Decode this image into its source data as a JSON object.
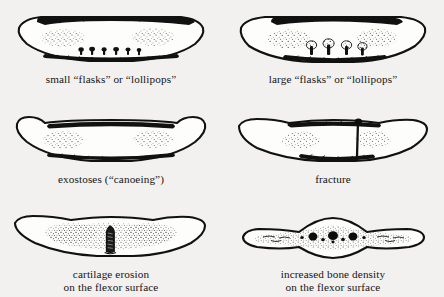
{
  "figure": {
    "background_color": "#f2f1ef",
    "ink_color": "#111111",
    "layout": "2 columns x 3 rows of labelled anatomical line drawings",
    "panels": [
      {
        "id": "small-flasks",
        "caption": "small “flasks” or “lollipops”",
        "drawing_name": "bone-cross-section-small-flasks",
        "description": "Lens-shaped bone cross-section with dense cortical bands top and bottom and small flask-shaped lesions along the lower surface"
      },
      {
        "id": "large-flasks",
        "caption": "large “flasks” or “lollipops”",
        "drawing_name": "bone-cross-section-large-flasks",
        "description": "Same bone outline with larger mushroom/lollipop shaped lesions projecting upward from the lower cortical surface"
      },
      {
        "id": "exostoses",
        "caption": "exostoses (“canoeing”)",
        "drawing_name": "bone-cross-section-exostoses-canoeing",
        "description": "Bone with upturned flared ends giving a canoe-like profile"
      },
      {
        "id": "fracture",
        "caption": "fracture",
        "drawing_name": "bone-cross-section-fracture",
        "description": "Bone cross-section crossed by a vertical fracture line right of centre"
      },
      {
        "id": "cartilage-erosion",
        "caption": "cartilage erosion\non the flexor surface",
        "drawing_name": "bone-cross-section-cartilage-erosion",
        "description": "Bone with a dark wedge-shaped erosion notch rising from the middle of the lower flexor surface"
      },
      {
        "id": "increased-bone-density",
        "caption": "increased bone density\non the flexor surface",
        "drawing_name": "bone-cross-section-increased-density",
        "description": "Thin arched bone with a dense stippled band and dark round blobs along the flexor surface"
      }
    ]
  }
}
